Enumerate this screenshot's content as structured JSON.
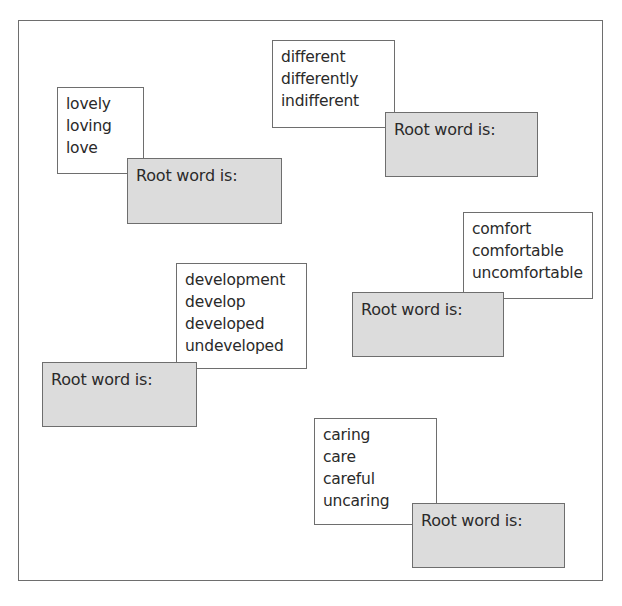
{
  "worksheet": {
    "root_label": "Root word is:",
    "groups": [
      {
        "words": [
          "lovely",
          "loving",
          "love"
        ],
        "root_label": "Root word is:",
        "root_answer": ""
      },
      {
        "words": [
          "different",
          "differently",
          "indifferent"
        ],
        "root_label": "Root word is:",
        "root_answer": ""
      },
      {
        "words": [
          "comfort",
          "comfortable",
          "uncomfortable"
        ],
        "root_label": "Root word is:",
        "root_answer": ""
      },
      {
        "words": [
          "development",
          "develop",
          "developed",
          "undeveloped"
        ],
        "root_label": "Root word is:",
        "root_answer": ""
      },
      {
        "words": [
          "caring",
          "care",
          "careful",
          "uncaring"
        ],
        "root_label": "Root word is:",
        "root_answer": ""
      }
    ],
    "colors": {
      "border": "#6e6e6e",
      "root_box_fill": "#dcdcdc",
      "word_box_fill": "#ffffff",
      "text": "#2a2a2a"
    }
  }
}
